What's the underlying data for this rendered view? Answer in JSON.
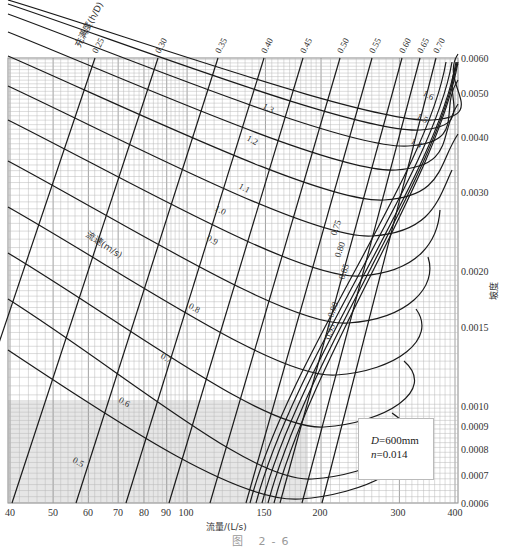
{
  "chart_data": {
    "type": "line",
    "title": "",
    "subtitle": "Nomogram for gravity sewer pipe hydraulic calculation",
    "xlabel": "流量/(L/s)",
    "ylabel": "坡度",
    "x_scale": "log",
    "y_scale": "log",
    "xlim": [
      40,
      420
    ],
    "ylim": [
      0.0006,
      0.006
    ],
    "grid": true,
    "x_ticks": [
      {
        "value": 40,
        "label": "40",
        "px": 10
      },
      {
        "value": 50,
        "label": "50",
        "px": 53
      },
      {
        "value": 60,
        "label": "60",
        "px": 88
      },
      {
        "value": 70,
        "label": "70",
        "px": 118
      },
      {
        "value": 80,
        "label": "80",
        "px": 144
      },
      {
        "value": 90,
        "label": "90",
        "px": 166
      },
      {
        "value": 100,
        "label": "100",
        "px": 186
      },
      {
        "value": 150,
        "label": "150",
        "px": 264
      },
      {
        "value": 200,
        "label": "200",
        "px": 320
      },
      {
        "value": 300,
        "label": "300",
        "px": 398
      },
      {
        "value": 400,
        "label": "400",
        "px": 455
      }
    ],
    "y_ticks": [
      {
        "value": 0.006,
        "label": "0.0060",
        "px": 58
      },
      {
        "value": 0.005,
        "label": "0.0050",
        "px": 93
      },
      {
        "value": 0.004,
        "label": "0.0040",
        "px": 137
      },
      {
        "value": 0.003,
        "label": "0.0030",
        "px": 192
      },
      {
        "value": 0.002,
        "label": "0.0020",
        "px": 271
      },
      {
        "value": 0.0015,
        "label": "0.0015",
        "px": 327
      },
      {
        "value": 0.001,
        "label": "0.0010",
        "px": 406
      },
      {
        "value": 0.0009,
        "label": "0.0009",
        "px": 426
      },
      {
        "value": 0.0008,
        "label": "0.0008",
        "px": 449
      },
      {
        "value": 0.0007,
        "label": "0.0007",
        "px": 475
      },
      {
        "value": 0.0006,
        "label": "0.0006",
        "px": 503
      }
    ],
    "filling_ratio_family": {
      "name": "充满度(h/D)",
      "labels": [
        "0.25",
        "0.30",
        "0.35",
        "0.40",
        "0.45",
        "0.50",
        "0.55",
        "0.60",
        "0.65",
        "0.70",
        "0.75",
        "0.80",
        "0.85",
        "0.90",
        "0.95"
      ]
    },
    "velocity_family": {
      "name": "流速(m/s)",
      "labels": [
        "0.5",
        "0.6",
        "0.7",
        "0.8",
        "0.9",
        "1.0",
        "1.1",
        "1.2",
        "1.3",
        "1.4",
        "1.5",
        "1.6"
      ]
    },
    "annotation": {
      "pipe_diameter": "D=600mm",
      "roughness": "n=0.014"
    }
  },
  "labels": {
    "top_family_title": "充满度(h/D)",
    "velocity_family_title": "流速(m/s)",
    "x_axis_title": "流量/(L/s)",
    "y_axis_title": "坡度",
    "legend_d_var": "D",
    "legend_d_val": "=600mm",
    "legend_n_var": "n",
    "legend_n_val": "=0.014",
    "caption": "图 2-6"
  },
  "colors": {
    "grid_fine": "#b8b8b8",
    "grid_major": "#8a8a8a",
    "curve": "#1a1a1a",
    "shade": "#e6e6e6"
  }
}
